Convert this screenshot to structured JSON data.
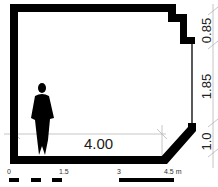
{
  "plan": {
    "wall_color": "#000000",
    "dimension_line_color": "#b0b0b0",
    "width_dimension": "4.00",
    "right_dimensions": [
      "0.85",
      "1.85",
      "1.0"
    ],
    "figure": "human-silhouette"
  },
  "scale_bar": {
    "labels": [
      "0",
      "1.5",
      "3",
      "4.5 m"
    ]
  }
}
